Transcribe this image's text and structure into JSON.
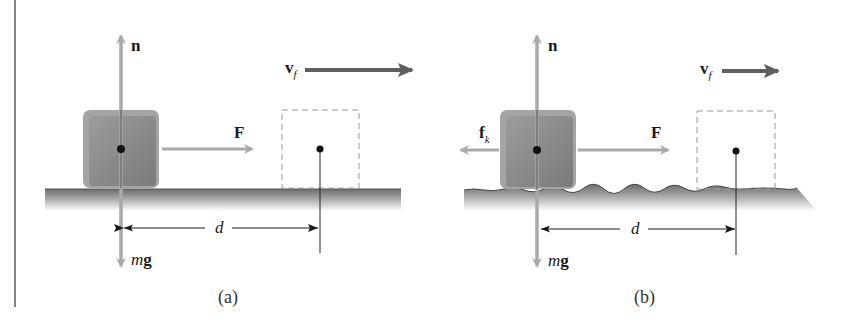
{
  "figure": {
    "panels": [
      {
        "id": "a",
        "caption": "(a)",
        "surface": "frictionless",
        "labels": {
          "normal": "n",
          "force": "F",
          "velocity_main": "v",
          "velocity_sub": "f",
          "displacement": "d",
          "weight_m": "m",
          "weight_g": "g"
        }
      },
      {
        "id": "b",
        "caption": "(b)",
        "surface": "rough",
        "labels": {
          "normal": "n",
          "force": "F",
          "friction_main": "f",
          "friction_sub": "k",
          "velocity_main": "v",
          "velocity_sub": "f",
          "displacement": "d",
          "weight_m": "m",
          "weight_g": "g"
        }
      }
    ],
    "colors": {
      "force_arrow": "#a9a9a9",
      "velocity_arrow": "#5f5f5f",
      "block_fill": "#8a8a8a",
      "ground_top": "#6a6a6a",
      "dashed_box": "#9a9a9a",
      "ink": "#1a1a1a"
    }
  }
}
